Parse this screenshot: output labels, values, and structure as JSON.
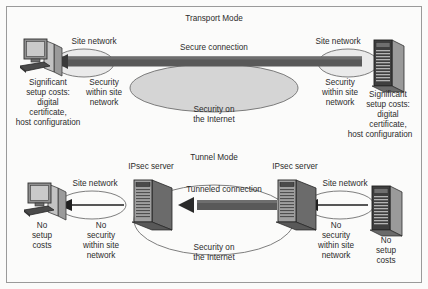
{
  "figure": {
    "border_color": "#9a9a9a",
    "background": "#fbfbfa",
    "ink": "#2b2b2b",
    "bar_dark": "#595959",
    "bar_mid": "#6e6e6e",
    "ellipse_fill": "#d5d5d5",
    "ellipse_stroke": "#6f6f6f",
    "site_oval_fill": "#eaeaea",
    "device_dark": "#3a3a3a",
    "device_mid": "#7a7a7a",
    "device_light": "#b9b9b9"
  },
  "transport_mode": {
    "title": "Transport Mode",
    "left_device": {
      "icon": "desktop-computer-icon",
      "caption": "Significant setup costs: digital certificate, host configuration"
    },
    "right_device": {
      "icon": "server-tower-icon",
      "caption": "Significant setup costs: digital certificate, host configuration"
    },
    "left_site_network_label": "Site network",
    "right_site_network_label": "Site network",
    "left_security_label": "Security within site network",
    "right_security_label": "Security within site network",
    "connection_label": "Secure connection",
    "internet_label": "Security on the Internet"
  },
  "tunnel_mode": {
    "title": "Tunnel Mode",
    "left_device": {
      "icon": "desktop-computer-icon",
      "caption": "No setup costs"
    },
    "right_device": {
      "icon": "server-tower-icon",
      "caption": "No setup costs"
    },
    "left_gateway": {
      "icon": "ipsec-server-icon",
      "label": "IPsec server"
    },
    "right_gateway": {
      "icon": "ipsec-server-icon",
      "label": "IPsec server"
    },
    "left_site_network_label": "Site network",
    "right_site_network_label": "Site network",
    "left_security_label": "No security within site network",
    "right_security_label": "No security within site network",
    "connection_label": "Tunneled connection",
    "internet_label": "Security on the Internet"
  },
  "text_lines": {
    "tm_left_caption": [
      "Significant",
      "setup costs:",
      "digital",
      "certificate,",
      "host configuration"
    ],
    "tm_right_caption": [
      "Significant",
      "setup costs:",
      "digital",
      "certificate,",
      "host configuration"
    ],
    "tm_left_security": [
      "Security",
      "within site",
      "network"
    ],
    "tm_right_security": [
      "Security",
      "within site",
      "network"
    ],
    "tm_internet": [
      "Security on",
      "the Internet"
    ],
    "tu_left_caption": [
      "No",
      "setup",
      "costs"
    ],
    "tu_right_caption": [
      "No",
      "setup",
      "costs"
    ],
    "tu_left_security": [
      "No",
      "security",
      "within site",
      "network"
    ],
    "tu_right_security": [
      "No",
      "security",
      "within site",
      "network"
    ],
    "tu_internet": [
      "Security on",
      "the Internet"
    ]
  }
}
